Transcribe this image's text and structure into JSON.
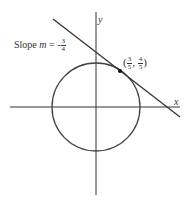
{
  "diagram": {
    "axes": {
      "x_label": "x",
      "y_label": "y"
    },
    "circle": {
      "equation": "x^2 + y^2 = 1",
      "center": [
        0,
        0
      ],
      "radius": 1
    },
    "tangent_line": {
      "slope_text": "Slope",
      "slope_var": "m",
      "equals": "=",
      "sign": "-",
      "slope_num": "3",
      "slope_den": "4"
    },
    "point": {
      "x_num": "3",
      "x_den": "5",
      "y_num": "4",
      "y_den": "5",
      "open": "(",
      "comma": ",",
      "close": ")"
    },
    "colors": {
      "stroke": "#333333",
      "background": "#ffffff"
    }
  }
}
